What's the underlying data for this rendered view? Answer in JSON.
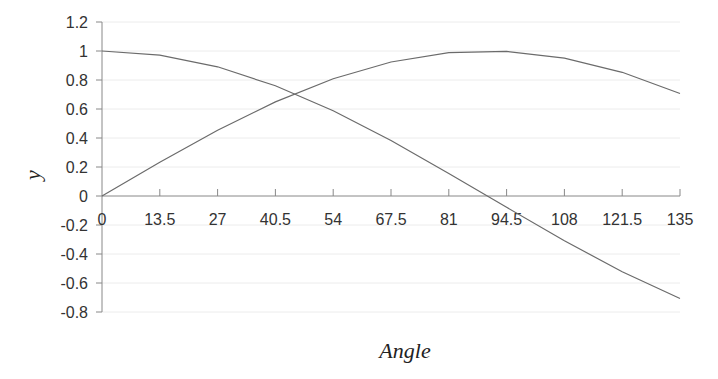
{
  "chart_data": {
    "type": "line",
    "title": "",
    "xlabel": "Angle",
    "ylabel": "y",
    "x": [
      0,
      13.5,
      27,
      40.5,
      54,
      67.5,
      81,
      94.5,
      108,
      121.5,
      135
    ],
    "x_tick_labels": [
      "0",
      "13.5",
      "27",
      "40.5",
      "54",
      "67.5",
      "81",
      "94.5",
      "108",
      "121.5",
      "135"
    ],
    "y_tick_labels": [
      "1.2",
      "1",
      "0.8",
      "0.6",
      "0.4",
      "0.2",
      "0",
      "-0.2",
      "-0.4",
      "-0.6",
      "-0.8"
    ],
    "y_ticks": [
      1.2,
      1,
      0.8,
      0.6,
      0.4,
      0.2,
      0,
      -0.2,
      -0.4,
      -0.6,
      -0.8
    ],
    "xlim": [
      0,
      135
    ],
    "ylim": [
      -0.8,
      1.2
    ],
    "grid": "horizontal, faint",
    "legend": "none",
    "series": [
      {
        "name": "sin(Angle)",
        "values": [
          0,
          0.233,
          0.454,
          0.649,
          0.809,
          0.924,
          0.988,
          0.997,
          0.951,
          0.853,
          0.707
        ]
      },
      {
        "name": "cos(Angle)",
        "values": [
          1,
          0.972,
          0.891,
          0.76,
          0.588,
          0.383,
          0.156,
          -0.078,
          -0.309,
          -0.522,
          -0.707
        ]
      }
    ],
    "colors": {
      "line": "#6b6b6b",
      "axis": "#888888",
      "grid": "#ececec",
      "text": "#333333"
    }
  }
}
